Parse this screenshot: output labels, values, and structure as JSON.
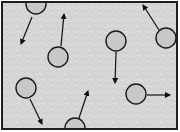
{
  "diagram": {
    "canvas": {
      "width": 180,
      "height": 132
    },
    "container": {
      "x": 2,
      "y": 2,
      "width": 175,
      "height": 127,
      "border_color": "#1e1e1e",
      "border_width": 2,
      "fill_color": "#d3d3d3",
      "texture_color": "#e6e6e6"
    },
    "particle_style": {
      "radius": 10,
      "fill_color": "#c8c8c8",
      "stroke_color": "#1a1a1a",
      "stroke_width": 1.4
    },
    "arrow_style": {
      "color": "#111111",
      "width": 1.2
    },
    "particles": [
      {
        "id": "particle-a",
        "cx": 36,
        "cy": 4,
        "arrow": {
          "x1": 32,
          "y1": 17,
          "x2": 21,
          "y2": 44
        },
        "direction": "down-left"
      },
      {
        "id": "particle-b",
        "cx": 58,
        "cy": 57,
        "arrow": {
          "x1": 61,
          "y1": 46,
          "x2": 64,
          "y2": 14
        },
        "direction": "up"
      },
      {
        "id": "particle-c",
        "cx": 116,
        "cy": 41,
        "arrow": {
          "x1": 116,
          "y1": 52,
          "x2": 115,
          "y2": 83
        },
        "direction": "down"
      },
      {
        "id": "particle-d",
        "cx": 166,
        "cy": 38,
        "arrow": {
          "x1": 159,
          "y1": 30,
          "x2": 143,
          "y2": 5
        },
        "direction": "up-left"
      },
      {
        "id": "particle-e",
        "cx": 26,
        "cy": 88,
        "arrow": {
          "x1": 30,
          "y1": 99,
          "x2": 42,
          "y2": 124
        },
        "direction": "down-right"
      },
      {
        "id": "particle-f",
        "cx": 75,
        "cy": 128,
        "arrow": {
          "x1": 79,
          "y1": 118,
          "x2": 88,
          "y2": 91
        },
        "direction": "up-right"
      },
      {
        "id": "particle-g",
        "cx": 136,
        "cy": 94,
        "arrow": {
          "x1": 147,
          "y1": 95,
          "x2": 170,
          "y2": 95
        },
        "direction": "right"
      }
    ]
  }
}
